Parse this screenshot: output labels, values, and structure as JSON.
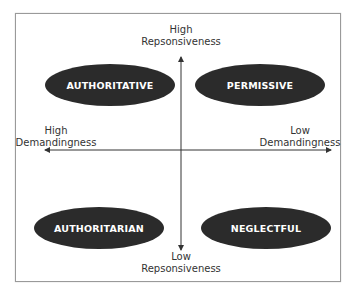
{
  "diagram": {
    "type": "quadrant",
    "axes": {
      "vertical": {
        "top_label": [
          "High",
          "Repsonsiveness"
        ],
        "bottom_label": [
          "Low",
          "Repsonsiveness"
        ]
      },
      "horizontal": {
        "left_label": [
          "High",
          "Demandingness"
        ],
        "right_label": [
          "Low",
          "Demandingness"
        ]
      }
    },
    "quadrants": {
      "top_left": "AUTHORITATIVE",
      "top_right": "PERMISSIVE",
      "bottom_left": "AUTHORITARIAN",
      "bottom_right": "NEGLECTFUL"
    },
    "colors": {
      "ellipse_fill": "#2b2b2b",
      "ellipse_text": "#ffffff",
      "axis": "#333333",
      "frame": "#9a9a9a"
    }
  }
}
